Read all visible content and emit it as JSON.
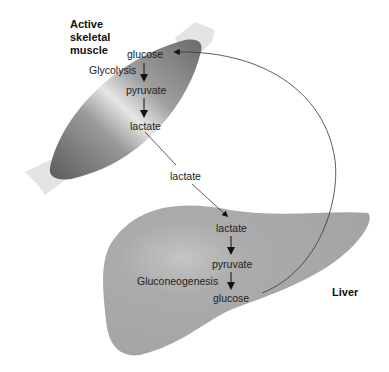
{
  "organs": {
    "muscle": {
      "label_lines": [
        "Active",
        "skeletal",
        "muscle"
      ]
    },
    "liver": {
      "label": "Liver"
    }
  },
  "muscle_pathway": {
    "process": "Glycolysis",
    "steps": [
      "glucose",
      "pyruvate",
      "lactate"
    ]
  },
  "transport": {
    "label": "lactate"
  },
  "liver_pathway": {
    "process": "Gluconeogenesis",
    "steps": [
      "lactate",
      "pyruvate",
      "glucose"
    ]
  },
  "colors": {
    "muscle_dark": "#6a6a6a",
    "muscle_light": "#e0e0e0",
    "liver": "#aaaaaa",
    "text": "#222222"
  }
}
